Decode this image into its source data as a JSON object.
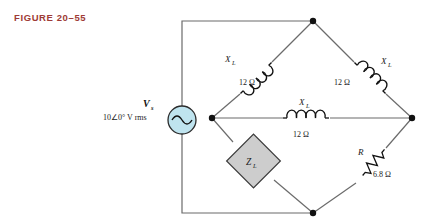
{
  "figure": {
    "label": "FIGURE 20–55",
    "color": "#9e3b36"
  },
  "source": {
    "symbol": "V",
    "subscript": "s",
    "value": "10∠0° V rms",
    "icon": "ac-source-icon",
    "fill": "#bfe4ef"
  },
  "components": {
    "inductor_top_left": {
      "symbol": "X",
      "subscript": "L",
      "value": "12 Ω",
      "icon": "inductor-icon"
    },
    "inductor_top_right": {
      "symbol": "X",
      "subscript": "L",
      "value": "12 Ω",
      "icon": "inductor-icon"
    },
    "inductor_bridge": {
      "symbol": "X",
      "subscript": "L",
      "value": "12 Ω",
      "icon": "inductor-icon"
    },
    "load": {
      "symbol": "Z",
      "subscript": "L",
      "icon": "load-box-icon",
      "fill": "#cdcdcd"
    },
    "resistor": {
      "symbol": "R",
      "value": "6.8 Ω",
      "icon": "resistor-icon"
    }
  },
  "nodes": {
    "top": "node-top",
    "left": "node-left",
    "right": "node-right",
    "bottom": "node-bottom"
  },
  "colors": {
    "wire": "#6b6b6b",
    "ink": "#1a1a1a"
  }
}
